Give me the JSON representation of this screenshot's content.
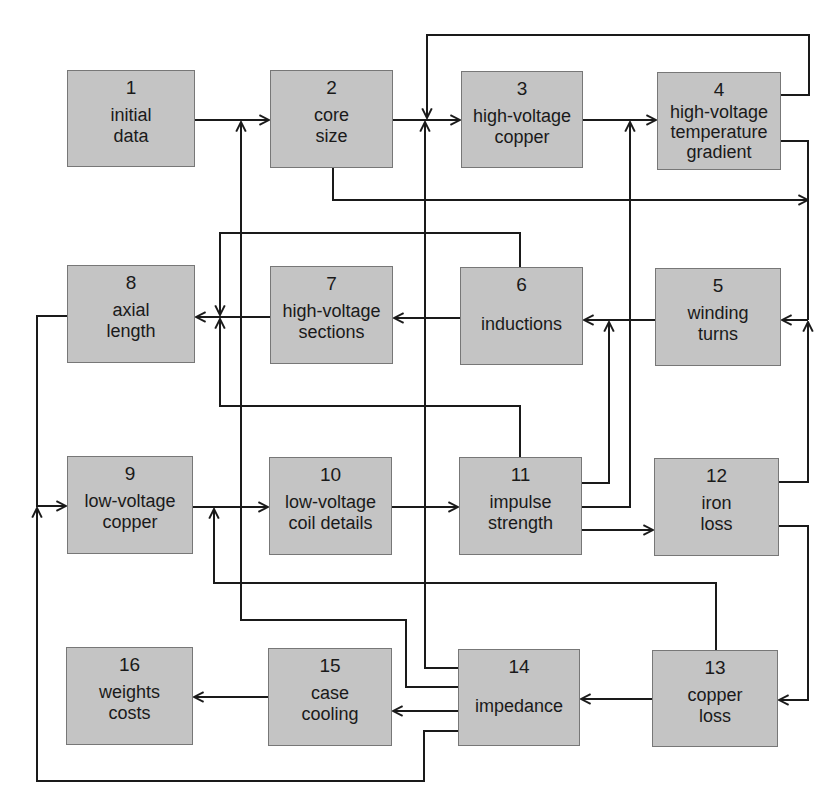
{
  "diagram": {
    "colors": {
      "box_fill": "#c4c4c4",
      "line": "#1a1a1a"
    },
    "boxes": [
      {
        "id": "1",
        "label": "initial\ndata"
      },
      {
        "id": "2",
        "label": "core\nsize"
      },
      {
        "id": "3",
        "label": "high-voltage\ncopper"
      },
      {
        "id": "4",
        "label": "high-voltage\ntemperature\ngradient"
      },
      {
        "id": "5",
        "label": "winding\nturns"
      },
      {
        "id": "6",
        "label": "inductions"
      },
      {
        "id": "7",
        "label": "high-voltage\nsections"
      },
      {
        "id": "8",
        "label": "axial\nlength"
      },
      {
        "id": "9",
        "label": "low-voltage\ncopper"
      },
      {
        "id": "10",
        "label": "low-voltage\ncoil details"
      },
      {
        "id": "11",
        "label": "impulse\nstrength"
      },
      {
        "id": "12",
        "label": "iron\nloss"
      },
      {
        "id": "13",
        "label": "copper\nloss"
      },
      {
        "id": "14",
        "label": "impedance"
      },
      {
        "id": "15",
        "label": "case\ncooling"
      },
      {
        "id": "16",
        "label": "weights\ncosts"
      }
    ]
  }
}
